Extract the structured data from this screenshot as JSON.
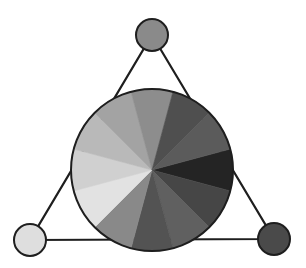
{
  "diagram": {
    "title": "Grayscale 12-part color wheel with primary triangle",
    "canvas": {
      "width": 306,
      "height": 268,
      "background": "#ffffff"
    },
    "stroke_color": "#1e1e1e",
    "triangle": {
      "stroke_width": 2.2,
      "vertices": [
        [
          152,
          35
        ],
        [
          274,
          239
        ],
        [
          30,
          240
        ]
      ]
    },
    "vertex_circles": [
      {
        "name": "top",
        "cx": 152,
        "cy": 35,
        "r": 16,
        "fill": "#8a8a8a"
      },
      {
        "name": "bottom-right",
        "cx": 274,
        "cy": 239,
        "r": 16,
        "fill": "#4a4a4a"
      },
      {
        "name": "bottom-left",
        "cx": 30,
        "cy": 240,
        "r": 16,
        "fill": "#dedede"
      }
    ],
    "wheel": {
      "cx": 152,
      "cy": 170,
      "r": 81,
      "segment_count": 12,
      "segment_width_deg": 30,
      "segments": [
        {
          "center_deg": 0,
          "fill": "#242424"
        },
        {
          "center_deg": 30,
          "fill": "#464646"
        },
        {
          "center_deg": 60,
          "fill": "#606060"
        },
        {
          "center_deg": 90,
          "fill": "#535353"
        },
        {
          "center_deg": 120,
          "fill": "#898989"
        },
        {
          "center_deg": 150,
          "fill": "#e2e2e2"
        },
        {
          "center_deg": 180,
          "fill": "#d0d0d0"
        },
        {
          "center_deg": 210,
          "fill": "#b9b9b9"
        },
        {
          "center_deg": 240,
          "fill": "#a3a3a3"
        },
        {
          "center_deg": 270,
          "fill": "#8d8d8d"
        },
        {
          "center_deg": 300,
          "fill": "#4f4f4f"
        },
        {
          "center_deg": 330,
          "fill": "#5b5b5b"
        }
      ]
    }
  }
}
